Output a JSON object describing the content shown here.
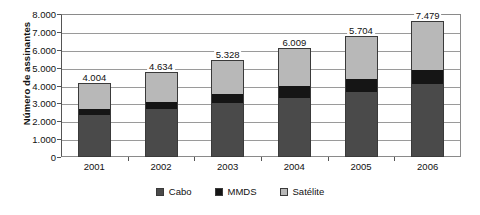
{
  "chart_data": {
    "type": "bar",
    "subtype": "stacked-vertical",
    "title": "",
    "xlabel": "",
    "ylabel": "Número de assinantes",
    "categories": [
      "2001",
      "2002",
      "2003",
      "2004",
      "2005",
      "2006"
    ],
    "series": [
      {
        "name": "Cabo",
        "color": "#4a4a4a",
        "values": [
          2300,
          2650,
          2950,
          3270,
          3580,
          4030
        ]
      },
      {
        "name": "MMDS",
        "color": "#151515",
        "values": [
          330,
          400,
          520,
          650,
          740,
          760
        ]
      },
      {
        "name": "Satélite",
        "color": "#b8b8b8",
        "values": [
          1374,
          1584,
          1858,
          2089,
          2340,
          2689
        ]
      }
    ],
    "bar_labels": [
      "4.004",
      "4.634",
      "5.328",
      "6.009",
      "5.704",
      "7.479"
    ],
    "bar_totals": [
      4004,
      4634,
      5328,
      6009,
      5704,
      7479
    ],
    "ylim": [
      0,
      8000
    ],
    "ytick_values": [
      0,
      1000,
      2000,
      3000,
      4000,
      5000,
      6000,
      7000,
      8000
    ],
    "ytick_labels": [
      "0",
      "1.000",
      "2.000",
      "3.000",
      "4.000",
      "5.000",
      "6.000",
      "7.000",
      "8.000"
    ],
    "grid": true,
    "grid_axis": "y",
    "legend": [
      "Cabo",
      "MMDS",
      "Satélite"
    ],
    "legend_position": "bottom-center"
  }
}
